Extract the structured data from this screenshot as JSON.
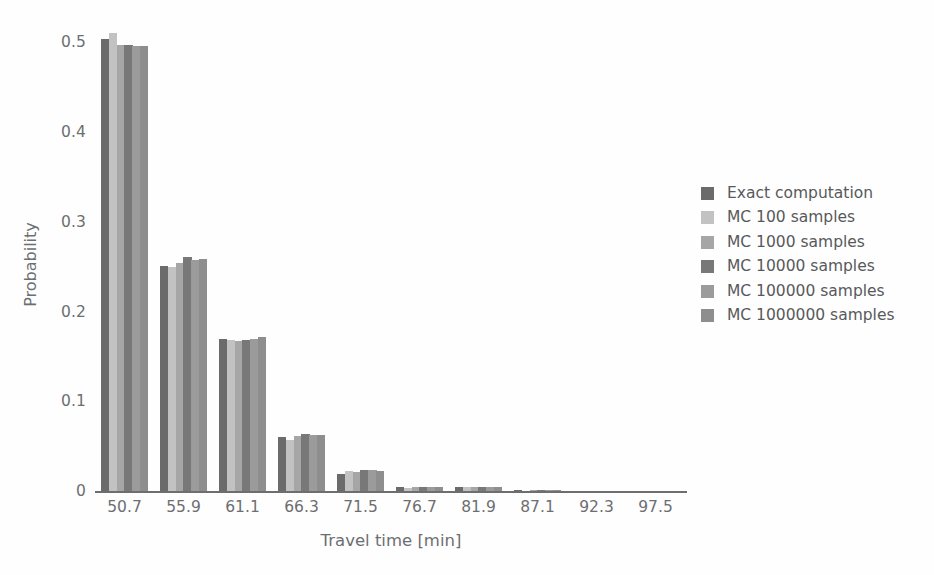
{
  "chart_data": {
    "type": "bar",
    "title": "",
    "xlabel": "Travel time [min]",
    "ylabel": "Probability",
    "categories": [
      "50.7",
      "55.9",
      "61.1",
      "66.3",
      "71.5",
      "76.7",
      "81.9",
      "87.1",
      "92.3",
      "97.5"
    ],
    "xtick_labels": [
      "50.7",
      "55.9",
      "61.1",
      "66.3",
      "71.5",
      "76.7",
      "81.9",
      "87.1",
      "92.3",
      "97.5"
    ],
    "ytick_labels": [
      "0",
      "0.1",
      "0.2",
      "0.3",
      "0.4",
      "0.5"
    ],
    "ytick_values": [
      0,
      0.1,
      0.2,
      0.3,
      0.4,
      0.5
    ],
    "ylim": [
      0,
      0.525
    ],
    "grid": false,
    "legend_position": "right",
    "series": [
      {
        "name": "Exact computation",
        "color": "#6b6b6b",
        "values": [
          0.504,
          0.251,
          0.17,
          0.06,
          0.0195,
          0.0045,
          0.0042,
          0.0006,
          0.0001,
          0.0
        ]
      },
      {
        "name": "MC 100 samples",
        "color": "#c2c2c2",
        "values": [
          0.51,
          0.25,
          0.168,
          0.057,
          0.022,
          0.003,
          0.004,
          0.0005,
          0.0,
          0.0
        ]
      },
      {
        "name": "MC 1000 samples",
        "color": "#a6a6a6",
        "values": [
          0.497,
          0.254,
          0.167,
          0.061,
          0.0215,
          0.004,
          0.0048,
          0.0006,
          0.0001,
          0.0
        ]
      },
      {
        "name": "MC 10000 samples",
        "color": "#787878",
        "values": [
          0.497,
          0.261,
          0.168,
          0.063,
          0.023,
          0.0042,
          0.005,
          0.0006,
          0.0001,
          0.0
        ]
      },
      {
        "name": "MC 100000 samples",
        "color": "#9b9b9b",
        "values": [
          0.496,
          0.258,
          0.169,
          0.062,
          0.0232,
          0.0044,
          0.0048,
          0.0006,
          0.0001,
          0.0
        ]
      },
      {
        "name": "MC 1000000 samples",
        "color": "#8e8e8e",
        "values": [
          0.496,
          0.259,
          0.172,
          0.062,
          0.0228,
          0.0045,
          0.0047,
          0.0006,
          0.0001,
          0.0
        ]
      }
    ]
  },
  "legend": {
    "items": [
      {
        "label": "Exact computation",
        "color": "#6b6b6b"
      },
      {
        "label": "MC 100 samples",
        "color": "#c2c2c2"
      },
      {
        "label": "MC 1000 samples",
        "color": "#a6a6a6"
      },
      {
        "label": "MC 10000 samples",
        "color": "#787878"
      },
      {
        "label": "MC 100000 samples",
        "color": "#9b9b9b"
      },
      {
        "label": "MC 1000000 samples",
        "color": "#8e8e8e"
      }
    ]
  },
  "axes": {
    "x_title": "Travel time [min]",
    "y_title": "Probability"
  },
  "colors": {
    "background": "#fefefe",
    "axis": "#6d6e71",
    "tick_text": "#6d6e71",
    "legend_text": "#58595b"
  }
}
